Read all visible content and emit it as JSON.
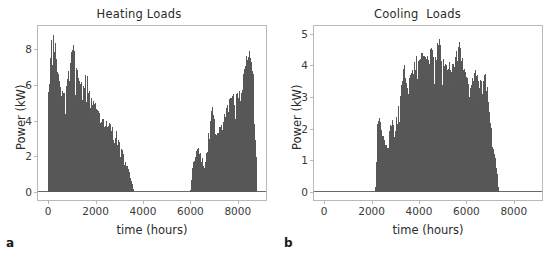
{
  "figure": {
    "panels": [
      {
        "letter": "a",
        "title": "Heating Loads",
        "xlabel": "time (hours)",
        "ylabel": "Power (kW)"
      },
      {
        "letter": "b",
        "title": "Cooling  Loads",
        "xlabel": "time (hours)",
        "ylabel": "Power (kW)"
      }
    ]
  },
  "style": {
    "fill_color": "#585858",
    "spine_color": "#b8b8b8",
    "text_color": "#2b2b2b",
    "background": "#ffffff"
  },
  "chart_data": [
    {
      "type": "area",
      "title": "Heating Loads",
      "xlabel": "time (hours)",
      "ylabel": "Power (kW)",
      "xlim": [
        -430,
        9190
      ],
      "ylim": [
        -0.45,
        9.3
      ],
      "xticks": [
        0,
        2000,
        4000,
        6000,
        8000
      ],
      "xticklabels": [
        "0",
        "2000",
        "4000",
        "6000",
        "8000"
      ],
      "yticks": [
        0,
        2,
        4,
        6,
        8
      ],
      "yticklabels": [
        "0",
        "2",
        "4",
        "6",
        "8"
      ],
      "grid": false,
      "legend": null,
      "series": [
        {
          "name": "Heating power",
          "description": "Hourly heating demand over one year (8760 h). High in winter months at start and end of year, zero from about hour 3600 to hour 5980.",
          "units": "kW",
          "peak_value": 8.9,
          "peak_hour": 230,
          "zero_interval": [
            3600,
            5980
          ],
          "envelope_x": [
            0,
            100,
            230,
            350,
            500,
            700,
            900,
            1050,
            1250,
            1450,
            1600,
            1800,
            2000,
            2200,
            2400,
            2600,
            2800,
            3000,
            3200,
            3400,
            3600,
            4000,
            5000,
            5980,
            6100,
            6300,
            6600,
            6900,
            7100,
            7300,
            7600,
            7900,
            8100,
            8300,
            8500,
            8650,
            8760
          ],
          "envelope_max": [
            6.1,
            8.35,
            8.9,
            7.3,
            5.8,
            5.45,
            7.2,
            8.6,
            6.4,
            6.1,
            6.65,
            5.2,
            5.1,
            4.15,
            4.0,
            3.85,
            3.6,
            2.75,
            2.0,
            1.1,
            0.0,
            0.0,
            0.0,
            0.0,
            1.6,
            2.55,
            1.6,
            4.85,
            3.3,
            3.95,
            5.1,
            5.75,
            5.6,
            7.45,
            8.0,
            6.5,
            1.8
          ],
          "envelope_min": [
            0.0,
            0.4,
            0.6,
            0.2,
            0.0,
            0.0,
            0.2,
            0.3,
            0.0,
            0.0,
            0.1,
            0.0,
            0.0,
            0.0,
            0.0,
            0.0,
            0.0,
            0.0,
            0.0,
            0.0,
            0.0,
            0.0,
            0.0,
            0.0,
            0.0,
            0.0,
            0.0,
            0.0,
            0.0,
            0.0,
            0.0,
            0.0,
            0.0,
            0.0,
            0.0,
            0.0,
            0.0
          ]
        }
      ]
    },
    {
      "type": "area",
      "title": "Cooling  Loads",
      "xlabel": "time (hours)",
      "ylabel": "Power (kW)",
      "xlim": [
        -430,
        9190
      ],
      "ylim": [
        -0.26,
        5.25
      ],
      "xticks": [
        0,
        2000,
        4000,
        6000,
        8000
      ],
      "xticklabels": [
        "0",
        "2000",
        "4000",
        "6000",
        "8000"
      ],
      "yticks": [
        0,
        1,
        2,
        3,
        4,
        5
      ],
      "yticklabels": [
        "0",
        "1",
        "2",
        "3",
        "4",
        "5"
      ],
      "grid": false,
      "legend": null,
      "series": [
        {
          "name": "Cooling power",
          "description": "Hourly cooling demand over one year (8760 h). Zero until about hour 2150, bell-shaped summer peak near hour 4800, returns to zero after about hour 7300.",
          "units": "kW",
          "peak_value": 4.98,
          "peak_hour": 4800,
          "zero_intervals": [
            [
              0,
              2150
            ],
            [
              7300,
              8760
            ]
          ],
          "envelope_x": [
            0,
            2150,
            2250,
            2400,
            2600,
            2800,
            3000,
            3200,
            3350,
            3500,
            3700,
            3900,
            4100,
            4300,
            4500,
            4650,
            4800,
            4950,
            5100,
            5300,
            5500,
            5700,
            5850,
            6000,
            6200,
            6400,
            6600,
            6800,
            6950,
            7100,
            7250,
            7350,
            8760
          ],
          "envelope_max": [
            0.0,
            0.0,
            2.6,
            1.95,
            1.35,
            2.35,
            2.2,
            3.05,
            4.1,
            3.5,
            3.85,
            4.35,
            4.4,
            4.2,
            4.55,
            4.3,
            4.98,
            4.35,
            4.1,
            4.2,
            4.25,
            4.75,
            4.1,
            3.6,
            3.55,
            4.0,
            3.45,
            3.75,
            2.5,
            1.45,
            0.8,
            0.0,
            0.0
          ],
          "envelope_min": [
            0.0,
            0.0,
            0.0,
            0.0,
            0.0,
            0.0,
            0.0,
            0.0,
            0.0,
            0.0,
            0.0,
            0.0,
            0.0,
            0.0,
            0.0,
            0.0,
            0.0,
            0.0,
            0.0,
            0.0,
            0.0,
            0.0,
            0.0,
            0.0,
            0.0,
            0.0,
            0.0,
            0.0,
            0.0,
            0.0,
            0.0,
            0.0,
            0.0
          ]
        }
      ]
    }
  ]
}
